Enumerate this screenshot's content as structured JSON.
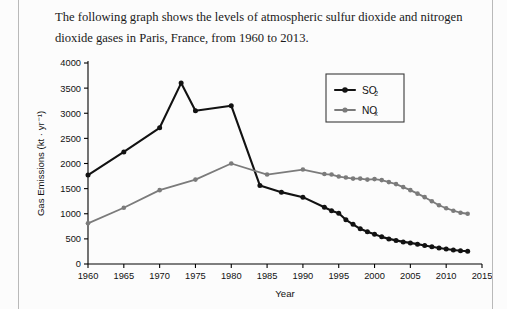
{
  "document": {
    "prompt_text": "The following graph shows the levels of atmospheric sulfur dioxide and nitrogen dioxide gases in Paris, France, from 1960 to 2013."
  },
  "chart_data": {
    "type": "line",
    "title": "",
    "xlabel": "Year",
    "ylabel": "Gas Emissions (kt · yr⁻¹)",
    "xlim": [
      1960,
      2015
    ],
    "ylim": [
      0,
      4000
    ],
    "xticks": [
      1960,
      1965,
      1970,
      1975,
      1980,
      1985,
      1990,
      1995,
      2000,
      2005,
      2010,
      2015
    ],
    "yticks": [
      0,
      500,
      1000,
      1500,
      2000,
      2500,
      3000,
      3500,
      4000
    ],
    "grid": false,
    "legend_position": "upper right",
    "series": [
      {
        "name": "SO2",
        "legend_base": "SO",
        "legend_sub": "2",
        "color": "#121212",
        "marker": "circle",
        "x": [
          1960,
          1965,
          1970,
          1973,
          1975,
          1980,
          1984,
          1987,
          1990,
          1993,
          1994,
          1995,
          1996,
          1997,
          1998,
          1999,
          2000,
          2001,
          2002,
          2003,
          2004,
          2005,
          2006,
          2007,
          2008,
          2009,
          2010,
          2011,
          2012,
          2013
        ],
        "y": [
          1770,
          2230,
          2710,
          3600,
          3050,
          3150,
          1560,
          1430,
          1330,
          1130,
          1060,
          1010,
          880,
          790,
          700,
          640,
          590,
          540,
          500,
          470,
          440,
          420,
          395,
          370,
          345,
          320,
          300,
          280,
          265,
          255
        ]
      },
      {
        "name": "NOx",
        "legend_base": "NO",
        "legend_sub": "x",
        "color": "#7b7b7b",
        "marker": "circle",
        "x": [
          1960,
          1965,
          1970,
          1975,
          1980,
          1985,
          1990,
          1993,
          1994,
          1995,
          1996,
          1997,
          1998,
          1999,
          2000,
          2001,
          2002,
          2003,
          2004,
          2005,
          2006,
          2007,
          2008,
          2009,
          2010,
          2011,
          2012,
          2013
        ],
        "y": [
          810,
          1120,
          1470,
          1680,
          2000,
          1780,
          1880,
          1790,
          1780,
          1740,
          1720,
          1700,
          1700,
          1680,
          1690,
          1670,
          1630,
          1590,
          1530,
          1470,
          1400,
          1330,
          1250,
          1170,
          1110,
          1060,
          1020,
          1000
        ]
      }
    ]
  }
}
